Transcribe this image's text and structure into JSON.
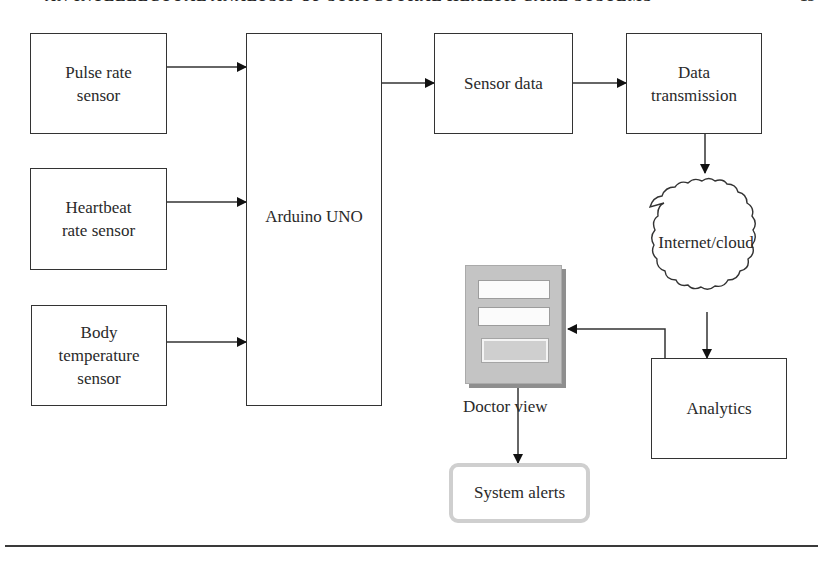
{
  "page_header": {
    "running_title": "AN INTELLECTUAL ANALYSIS OF STRUCTURAL HEALTH CARE SYSTEMS",
    "page_number": "15"
  },
  "diagram": {
    "sensors": [
      {
        "id": "pulse",
        "label": "Pulse rate\nsensor"
      },
      {
        "id": "heartbeat",
        "label": "Heartbeat\nrate sensor"
      },
      {
        "id": "temperature",
        "label": "Body\ntemperature\nsensor"
      }
    ],
    "controller": {
      "label": "Arduino UNO"
    },
    "sensor_data": {
      "label": "Sensor data"
    },
    "transmission": {
      "label": "Data\ntransmission"
    },
    "cloud": {
      "label": "Internet/cloud"
    },
    "analytics": {
      "label": "Analytics"
    },
    "doctor_view": {
      "label": "Doctor view"
    },
    "alerts": {
      "label": "System alerts"
    },
    "edges": [
      [
        "Pulse rate sensor",
        "Arduino UNO"
      ],
      [
        "Heartbeat rate sensor",
        "Arduino UNO"
      ],
      [
        "Body temperature sensor",
        "Arduino UNO"
      ],
      [
        "Arduino UNO",
        "Sensor data"
      ],
      [
        "Sensor data",
        "Data transmission"
      ],
      [
        "Data transmission",
        "Internet/cloud"
      ],
      [
        "Internet/cloud",
        "Analytics"
      ],
      [
        "Analytics",
        "Doctor view"
      ],
      [
        "Doctor view",
        "System alerts"
      ]
    ]
  }
}
